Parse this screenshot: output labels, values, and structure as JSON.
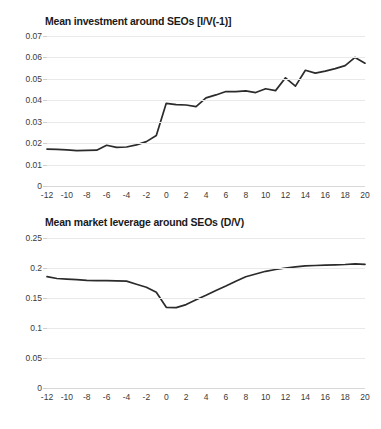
{
  "figure": {
    "background_color": "#ffffff",
    "line_color": "#2b2b2b",
    "grid_color": "#e9e9e9"
  },
  "charts": [
    {
      "id": "investment",
      "title": "Mean investment around SEOs [I/V(-1)]",
      "yticks": [
        "0.07",
        "0.06",
        "0.05",
        "0.04",
        "0.03",
        "0.02",
        "0.01",
        "0"
      ],
      "xticks": [
        "-12",
        "-10",
        "-8",
        "-6",
        "-4",
        "-2",
        "0",
        "2",
        "4",
        "6",
        "8",
        "10",
        "12",
        "14",
        "16",
        "18",
        "20"
      ]
    },
    {
      "id": "leverage",
      "title": "Mean market leverage around SEOs (D/V)",
      "yticks": [
        "0.25",
        "0.2",
        "0.15",
        "0.1",
        "0.05",
        "0"
      ],
      "xticks": [
        "-12",
        "-10",
        "-8",
        "-6",
        "-4",
        "-2",
        "0",
        "2",
        "4",
        "6",
        "8",
        "10",
        "12",
        "14",
        "16",
        "18",
        "20"
      ]
    }
  ],
  "chart_data": [
    {
      "type": "line",
      "title": "Mean investment around SEOs [I/V(-1)]",
      "xlabel": "",
      "ylabel": "",
      "xlim": [
        -12,
        20
      ],
      "ylim": [
        0,
        0.07
      ],
      "ytick_values": [
        0,
        0.01,
        0.02,
        0.03,
        0.04,
        0.05,
        0.06,
        0.07
      ],
      "xtick_values": [
        -12,
        -10,
        -8,
        -6,
        -4,
        -2,
        0,
        2,
        4,
        6,
        8,
        10,
        12,
        14,
        16,
        18,
        20
      ],
      "grid": true,
      "legend": false,
      "x": [
        -12,
        -11,
        -10,
        -9,
        -8,
        -7,
        -6,
        -5,
        -4,
        -3,
        -2,
        -1,
        0,
        1,
        2,
        3,
        4,
        5,
        6,
        7,
        8,
        9,
        10,
        11,
        12,
        13,
        14,
        15,
        16,
        17,
        18,
        19,
        20
      ],
      "y": [
        0.0172,
        0.0171,
        0.0169,
        0.0165,
        0.0166,
        0.0167,
        0.019,
        0.018,
        0.0182,
        0.0192,
        0.0207,
        0.0236,
        0.0386,
        0.038,
        0.0378,
        0.037,
        0.0411,
        0.0425,
        0.0441,
        0.044,
        0.0444,
        0.0436,
        0.0454,
        0.0445,
        0.0505,
        0.0466,
        0.054,
        0.0527,
        0.0536,
        0.0548,
        0.0562,
        0.06,
        0.0573
      ]
    },
    {
      "type": "line",
      "title": "Mean market leverage around SEOs (D/V)",
      "xlabel": "",
      "ylabel": "",
      "xlim": [
        -12,
        20
      ],
      "ylim": [
        0,
        0.25
      ],
      "ytick_values": [
        0,
        0.05,
        0.1,
        0.15,
        0.2,
        0.25
      ],
      "xtick_values": [
        -12,
        -10,
        -8,
        -6,
        -4,
        -2,
        0,
        2,
        4,
        6,
        8,
        10,
        12,
        14,
        16,
        18,
        20
      ],
      "grid": true,
      "legend": false,
      "x": [
        -12,
        -11,
        -10,
        -9,
        -8,
        -7,
        -6,
        -5,
        -4,
        -3,
        -2,
        -1,
        0,
        1,
        2,
        3,
        4,
        5,
        6,
        7,
        8,
        9,
        10,
        11,
        12,
        13,
        14,
        15,
        16,
        17,
        18,
        19,
        20
      ],
      "y": [
        0.1855,
        0.1825,
        0.1815,
        0.1805,
        0.1795,
        0.179,
        0.1788,
        0.1786,
        0.1782,
        0.173,
        0.168,
        0.1595,
        0.1345,
        0.134,
        0.139,
        0.147,
        0.1545,
        0.1625,
        0.17,
        0.178,
        0.1855,
        0.19,
        0.1945,
        0.1975,
        0.2,
        0.202,
        0.2035,
        0.2042,
        0.2048,
        0.2053,
        0.2058,
        0.2068,
        0.206
      ]
    }
  ]
}
